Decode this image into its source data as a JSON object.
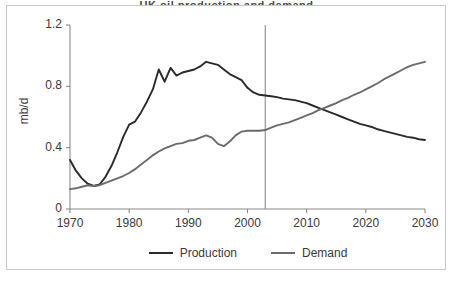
{
  "figure": {
    "title_sliver": "UK oil production and demand",
    "background": "#ffffff",
    "border_color": "#c9c9c9"
  },
  "axis": {
    "ylabel": "mb/d",
    "yticks": [
      "0",
      "0.4",
      "0.8",
      "1.2"
    ],
    "xticks": [
      "1970",
      "1980",
      "1990",
      "2000",
      "2010",
      "2020",
      "2030"
    ]
  },
  "legend": {
    "items": [
      {
        "label": "Production",
        "color": "#2a2a2a"
      },
      {
        "label": "Demand",
        "color": "#6b6b6b"
      }
    ]
  },
  "chart_data": {
    "type": "line",
    "title": "",
    "xlabel": "",
    "ylabel": "mb/d",
    "xlim": [
      1970,
      2030
    ],
    "ylim": [
      0,
      1.2
    ],
    "yticks": [
      0,
      0.4,
      0.8,
      1.2
    ],
    "xticks": [
      1970,
      1980,
      1990,
      2000,
      2010,
      2020,
      2030
    ],
    "grid": false,
    "legend_position": "bottom",
    "annotations": [
      {
        "type": "vertical-line",
        "x": 2003,
        "color": "#8a8a8a",
        "note": "history / forecast divider"
      }
    ],
    "x": [
      1970,
      1971,
      1972,
      1973,
      1974,
      1975,
      1976,
      1977,
      1978,
      1979,
      1980,
      1981,
      1982,
      1983,
      1984,
      1985,
      1986,
      1987,
      1988,
      1989,
      1990,
      1991,
      1992,
      1993,
      1994,
      1995,
      1996,
      1997,
      1998,
      1999,
      2000,
      2001,
      2002,
      2003,
      2004,
      2005,
      2006,
      2007,
      2008,
      2009,
      2010,
      2011,
      2012,
      2013,
      2014,
      2015,
      2016,
      2017,
      2018,
      2019,
      2020,
      2021,
      2022,
      2023,
      2024,
      2025,
      2026,
      2027,
      2028,
      2029,
      2030
    ],
    "series": [
      {
        "name": "Production",
        "color": "#2a2a2a",
        "values": [
          0.32,
          0.25,
          0.2,
          0.165,
          0.15,
          0.16,
          0.21,
          0.28,
          0.37,
          0.47,
          0.55,
          0.57,
          0.63,
          0.7,
          0.78,
          0.91,
          0.83,
          0.92,
          0.87,
          0.89,
          0.9,
          0.91,
          0.93,
          0.96,
          0.95,
          0.94,
          0.91,
          0.88,
          0.86,
          0.84,
          0.79,
          0.76,
          0.745,
          0.74,
          0.735,
          0.73,
          0.72,
          0.715,
          0.71,
          0.7,
          0.69,
          0.675,
          0.66,
          0.645,
          0.63,
          0.615,
          0.6,
          0.585,
          0.57,
          0.555,
          0.545,
          0.535,
          0.52,
          0.51,
          0.5,
          0.49,
          0.48,
          0.47,
          0.465,
          0.455,
          0.45
        ]
      },
      {
        "name": "Demand",
        "color": "#6b6b6b",
        "values": [
          0.13,
          0.135,
          0.145,
          0.155,
          0.15,
          0.155,
          0.17,
          0.185,
          0.2,
          0.215,
          0.235,
          0.26,
          0.29,
          0.32,
          0.35,
          0.375,
          0.395,
          0.41,
          0.425,
          0.43,
          0.445,
          0.45,
          0.465,
          0.48,
          0.465,
          0.425,
          0.41,
          0.44,
          0.48,
          0.505,
          0.51,
          0.51,
          0.51,
          0.515,
          0.53,
          0.545,
          0.555,
          0.565,
          0.58,
          0.595,
          0.61,
          0.625,
          0.645,
          0.66,
          0.675,
          0.69,
          0.71,
          0.725,
          0.745,
          0.76,
          0.78,
          0.8,
          0.82,
          0.845,
          0.865,
          0.885,
          0.905,
          0.925,
          0.94,
          0.95,
          0.96
        ]
      }
    ]
  }
}
